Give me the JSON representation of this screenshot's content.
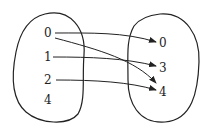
{
  "diagram": {
    "type": "mapping",
    "domain_set": {
      "elements": [
        "0",
        "1",
        "2",
        "4"
      ]
    },
    "codomain_set": {
      "elements": [
        "0",
        "3",
        "4"
      ]
    },
    "arrows": [
      {
        "from": "0",
        "to": "0"
      },
      {
        "from": "0",
        "to": "4"
      },
      {
        "from": "1",
        "to": "3"
      },
      {
        "from": "2",
        "to": "4"
      }
    ],
    "colors": {
      "stroke": "#222222",
      "background": "#ffffff"
    }
  }
}
